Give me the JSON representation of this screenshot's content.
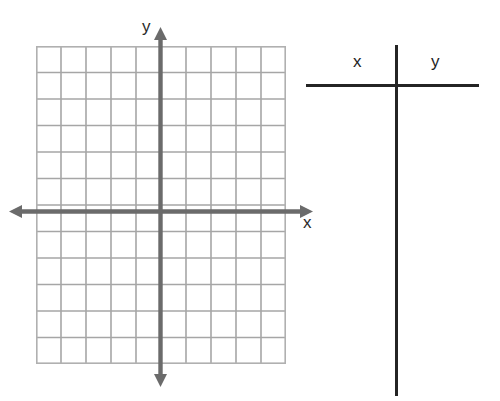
{
  "worksheet": {
    "title": "Coordinate grid with blank x-y table",
    "background_color": "#ffffff"
  },
  "graph": {
    "name": "cartesian-coordinate-plane",
    "grid": {
      "columns": 10,
      "rows": 12,
      "columns_left_of_y_axis": 5,
      "columns_right_of_y_axis": 5,
      "rows_above_x_axis": 6,
      "rows_below_x_axis": 6,
      "cell_width_px": 25,
      "cell_height_px": 26.5,
      "line_color": "#a6a6a6",
      "border_color": "#b0b0b0"
    },
    "axes": {
      "color": "#6b6b6b",
      "thickness_px": 4,
      "x_axis": {
        "label": "x",
        "has_left_arrow": true,
        "has_right_arrow": true
      },
      "y_axis": {
        "label": "y",
        "has_up_arrow": true,
        "has_down_arrow": true
      },
      "tick_labels": [],
      "origin_marked": false
    }
  },
  "table": {
    "name": "xy-value-table",
    "columns": [
      {
        "header": "x",
        "values": []
      },
      {
        "header": "y",
        "values": []
      }
    ],
    "rows": [],
    "rule_color": "#242424",
    "empty": true
  },
  "chart_data": {
    "type": "scatter",
    "title": "",
    "subtitle": "",
    "xlabel": "x",
    "ylabel": "y",
    "series": [
      {
        "name": "plotted points",
        "x": [],
        "y": []
      }
    ],
    "x": [],
    "categories": [],
    "values": [],
    "xlim": [
      -5,
      5
    ],
    "ylim": [
      -6,
      6
    ],
    "xticks": [
      -5,
      -4,
      -3,
      -2,
      -1,
      0,
      1,
      2,
      3,
      4,
      5
    ],
    "yticks": [
      -6,
      -5,
      -4,
      -3,
      -2,
      -1,
      0,
      1,
      2,
      3,
      4,
      5,
      6
    ],
    "xtick_labels": [],
    "ytick_labels": [],
    "grid": true,
    "grid_columns": 10,
    "grid_rows": 12,
    "legend": false,
    "legend_position": "none",
    "annotations": []
  }
}
